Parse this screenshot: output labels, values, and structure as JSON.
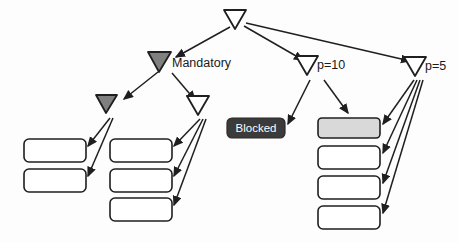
{
  "diagram": {
    "type": "task-tree",
    "background_color": "#fdfdfd",
    "stroke_color": "#1f1f1f",
    "colors": {
      "triangle_filled": "#808080",
      "triangle_hollow": "#ffffff",
      "box_default": "#ffffff",
      "box_highlight": "#d9d9d9",
      "blocked_fill": "#3b3b3b",
      "blocked_text": "#ffffff",
      "label_text": "#1a1a1a"
    },
    "nodes": [
      {
        "id": "root",
        "shape": "triangle-down",
        "fill": "hollow",
        "label": "",
        "x": 235,
        "y": 19,
        "w": 22,
        "h": 19
      },
      {
        "id": "mandatory",
        "shape": "triangle-down",
        "fill": "filled",
        "label": "Mandatory",
        "label_x": 172,
        "label_y": 67,
        "x": 159,
        "y": 62,
        "w": 23,
        "h": 20
      },
      {
        "id": "p10",
        "shape": "triangle-down",
        "fill": "hollow",
        "label": "p=10",
        "label_x": 319,
        "label_y": 69,
        "x": 307,
        "y": 65,
        "w": 22,
        "h": 19
      },
      {
        "id": "p5",
        "shape": "triangle-down",
        "fill": "hollow",
        "label": "p=5",
        "label_x": 427,
        "label_y": 70,
        "x": 415,
        "y": 66,
        "w": 22,
        "h": 19
      },
      {
        "id": "left-inner",
        "shape": "triangle-down",
        "fill": "filled",
        "label": "",
        "x": 106,
        "y": 104,
        "w": 21,
        "h": 18
      },
      {
        "id": "right-inner",
        "shape": "triangle-down",
        "fill": "hollow",
        "label": "",
        "x": 197,
        "y": 105,
        "w": 22,
        "h": 19
      }
    ],
    "boxes": [
      {
        "id": "box-l1",
        "label": "",
        "fill": "default",
        "x": 24,
        "y": 139,
        "w": 62,
        "h": 23
      },
      {
        "id": "box-l2",
        "label": "",
        "fill": "default",
        "x": 24,
        "y": 169,
        "w": 62,
        "h": 23
      },
      {
        "id": "box-m1",
        "label": "",
        "fill": "default",
        "x": 110,
        "y": 139,
        "w": 62,
        "h": 23
      },
      {
        "id": "box-m2",
        "label": "",
        "fill": "default",
        "x": 110,
        "y": 169,
        "w": 62,
        "h": 23
      },
      {
        "id": "box-m3",
        "label": "",
        "fill": "default",
        "x": 110,
        "y": 198,
        "w": 62,
        "h": 23
      },
      {
        "id": "box-blocked",
        "label": "Blocked",
        "fill": "blocked",
        "x": 227,
        "y": 118,
        "w": 58,
        "h": 20
      },
      {
        "id": "box-r1",
        "label": "",
        "fill": "highlight",
        "x": 318,
        "y": 118,
        "w": 62,
        "h": 20
      },
      {
        "id": "box-r2",
        "label": "",
        "fill": "default",
        "x": 318,
        "y": 146,
        "w": 62,
        "h": 23
      },
      {
        "id": "box-r3",
        "label": "",
        "fill": "default",
        "x": 318,
        "y": 176,
        "w": 62,
        "h": 23
      },
      {
        "id": "box-r4",
        "label": "",
        "fill": "default",
        "x": 318,
        "y": 206,
        "w": 62,
        "h": 23
      }
    ],
    "edges": [
      {
        "from": "root",
        "to": "mandatory"
      },
      {
        "from": "root",
        "to": "p10"
      },
      {
        "from": "root",
        "to": "p5"
      },
      {
        "from": "mandatory",
        "to": "left-inner"
      },
      {
        "from": "mandatory",
        "to": "right-inner"
      },
      {
        "from": "left-inner",
        "to": "box-l1"
      },
      {
        "from": "left-inner",
        "to": "box-l2"
      },
      {
        "from": "right-inner",
        "to": "box-m1"
      },
      {
        "from": "right-inner",
        "to": "box-m2"
      },
      {
        "from": "right-inner",
        "to": "box-m3"
      },
      {
        "from": "p10",
        "to": "box-blocked"
      },
      {
        "from": "p10",
        "to": "box-r1"
      },
      {
        "from": "p5",
        "to": "box-r1"
      },
      {
        "from": "p5",
        "to": "box-r2"
      },
      {
        "from": "p5",
        "to": "box-r3"
      },
      {
        "from": "p5",
        "to": "box-r4"
      }
    ]
  }
}
